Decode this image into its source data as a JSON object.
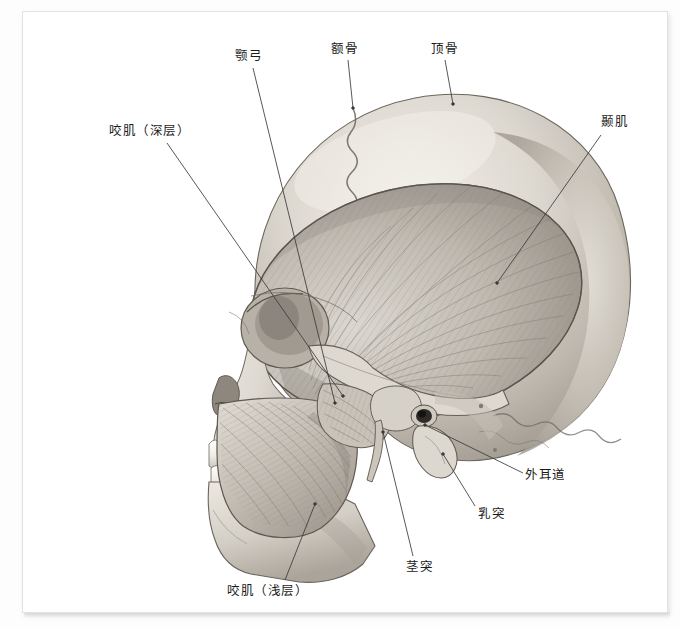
{
  "figure": {
    "view": "left-lateral",
    "rendering": "grayscale-airbrush-anatomical-illustration",
    "background_color": "#ffffff",
    "plate_border_color": "#e2e2e4",
    "bone_light": "#efece6",
    "bone_mid": "#cdc8bf",
    "bone_shadow": "#9b958c",
    "muscle_light": "#d8d4cd",
    "muscle_mid": "#b2aca3",
    "muscle_dark": "#817c74",
    "leader_color": "#3a3a3a",
    "label_color": "#1b1b1b"
  },
  "labels": [
    {
      "id": "masseter-deep",
      "text": "咬肌（深层）",
      "text_x": 86,
      "text_y": 112,
      "leader": {
        "x1": 144,
        "y1": 131,
        "x2": 320,
        "y2": 384
      },
      "anchor": "end"
    },
    {
      "id": "zygomatic-arch",
      "text": "颚弓",
      "text_x": 212,
      "text_y": 37,
      "leader": {
        "x1": 230,
        "y1": 56,
        "x2": 312,
        "y2": 391
      },
      "anchor": "end"
    },
    {
      "id": "frontal-bone",
      "text": "额骨",
      "text_x": 308,
      "text_y": 30,
      "leader": {
        "x1": 325,
        "y1": 48,
        "x2": 330,
        "y2": 96
      },
      "anchor": "end"
    },
    {
      "id": "parietal-bone",
      "text": "顶骨",
      "text_x": 408,
      "text_y": 30,
      "leader": {
        "x1": 422,
        "y1": 48,
        "x2": 430,
        "y2": 92
      },
      "anchor": "end"
    },
    {
      "id": "temporalis",
      "text": "颞肌",
      "text_x": 578,
      "text_y": 103,
      "leader": {
        "x1": 578,
        "y1": 123,
        "x2": 474,
        "y2": 271
      },
      "anchor": "start"
    },
    {
      "id": "external-acoustic-meatus",
      "text": "外耳道",
      "text_x": 502,
      "text_y": 456,
      "leader": {
        "x1": 500,
        "y1": 461,
        "x2": 402,
        "y2": 413
      },
      "anchor": "start"
    },
    {
      "id": "mastoid-process",
      "text": "乳突",
      "text_x": 455,
      "text_y": 495,
      "leader": {
        "x1": 452,
        "y1": 494,
        "x2": 420,
        "y2": 442
      },
      "anchor": "start"
    },
    {
      "id": "styloid-process",
      "text": "茎突",
      "text_x": 383,
      "text_y": 548,
      "leader": {
        "x1": 390,
        "y1": 544,
        "x2": 360,
        "y2": 420
      },
      "anchor": "start"
    },
    {
      "id": "masseter-superficial",
      "text": "咬肌（浅层）",
      "text_x": 204,
      "text_y": 572,
      "leader": {
        "x1": 262,
        "y1": 568,
        "x2": 292,
        "y2": 492
      },
      "anchor": "end"
    }
  ],
  "anatomy_parts": [
    {
      "name": "calvaria",
      "label": "cranial-vault"
    },
    {
      "name": "coronal-suture",
      "label": "zigzag-suture-line"
    },
    {
      "name": "lambdoid-suture",
      "label": "posterior-zigzag-suture"
    },
    {
      "name": "orbit",
      "label": "eye-socket"
    },
    {
      "name": "nasal-aperture",
      "label": "piriform-aperture"
    },
    {
      "name": "maxilla",
      "label": "upper-jaw"
    },
    {
      "name": "mandible",
      "label": "lower-jaw"
    },
    {
      "name": "upper-teeth",
      "label": "maxillary-dentition"
    },
    {
      "name": "lower-teeth",
      "label": "mandibular-dentition"
    },
    {
      "name": "temporalis-muscle",
      "label": "fan-shaped-muscle"
    },
    {
      "name": "masseter-superficial-muscle",
      "label": "oblique-fiber-muscle"
    },
    {
      "name": "zygomatic-arch-bone",
      "label": "cheek-bone-bridge"
    },
    {
      "name": "mastoid-process-bone",
      "label": "bony-prominence"
    },
    {
      "name": "styloid-process-bone",
      "label": "thin-spike"
    },
    {
      "name": "external-acoustic-meatus-opening",
      "label": "ear-canal-opening"
    }
  ]
}
